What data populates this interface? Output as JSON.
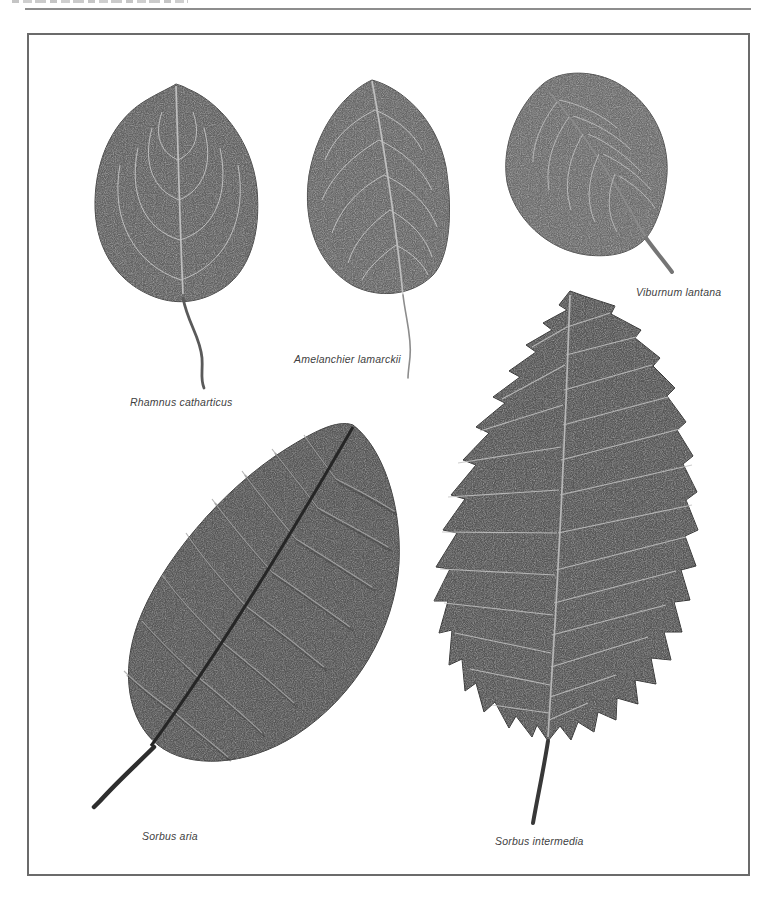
{
  "page": {
    "background": "#ffffff",
    "rule_color": "#8d8d8d",
    "frame_color": "#6b6b6b",
    "leaf_base_color": "#5c5c5c",
    "vein_color": "#c9c9c9",
    "label_color": "#3f3f3f"
  },
  "specimens": [
    {
      "label": "Rhamnus catharticus"
    },
    {
      "label": "Amelanchier lamarckii"
    },
    {
      "label": "Viburnum lantana"
    },
    {
      "label": "Sorbus aria"
    },
    {
      "label": "Sorbus intermedia"
    }
  ]
}
